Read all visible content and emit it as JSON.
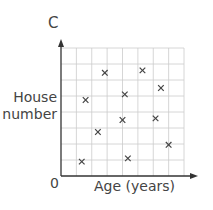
{
  "chart_data": {
    "type": "scatter",
    "title": "",
    "panel_label": "C",
    "xlabel": "Age (years)",
    "ylabel_lines": [
      "House",
      "number"
    ],
    "origin_label": "0",
    "xlim": [
      0,
      8
    ],
    "ylim": [
      0,
      8
    ],
    "grid": true,
    "legend": null,
    "marker": "x",
    "tick_labels_shown": false,
    "points": [
      {
        "x": 1.6,
        "y": 4.75
      },
      {
        "x": 2.85,
        "y": 6.45
      },
      {
        "x": 2.4,
        "y": 2.75
      },
      {
        "x": 1.35,
        "y": 0.9
      },
      {
        "x": 4.15,
        "y": 5.1
      },
      {
        "x": 4.0,
        "y": 3.5
      },
      {
        "x": 4.35,
        "y": 1.1
      },
      {
        "x": 5.3,
        "y": 6.6
      },
      {
        "x": 6.5,
        "y": 5.5
      },
      {
        "x": 6.15,
        "y": 3.6
      },
      {
        "x": 7.0,
        "y": 1.95
      }
    ]
  },
  "colors": {
    "axis": "#333333",
    "grid": "#cccccc",
    "marker": "#444444"
  }
}
